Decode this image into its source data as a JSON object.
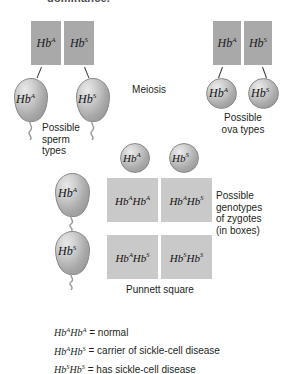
{
  "heading": {
    "text": "dominance."
  },
  "alleles": {
    "a": "Hb",
    "a_sup": "A",
    "s": "Hb",
    "s_sup": "S"
  },
  "parent_male": {
    "name": "male-parent-chromosomes",
    "chromosomes": [
      {
        "base": "Hb",
        "sup": "A"
      },
      {
        "base": "Hb",
        "sup": "S"
      }
    ]
  },
  "parent_female": {
    "name": "female-parent-chromosomes",
    "chromosomes": [
      {
        "base": "Hb",
        "sup": "A"
      },
      {
        "base": "Hb",
        "sup": "S"
      }
    ]
  },
  "meiosis_label": "Meiosis",
  "sperm": {
    "caption": [
      "Possible",
      "sperm",
      "types"
    ],
    "cells": [
      {
        "base": "Hb",
        "sup": "A"
      },
      {
        "base": "Hb",
        "sup": "S"
      }
    ]
  },
  "ova": {
    "caption": [
      "Possible",
      "ova types"
    ],
    "cells": [
      {
        "base": "Hb",
        "sup": "A"
      },
      {
        "base": "Hb",
        "sup": "S"
      }
    ]
  },
  "punnett": {
    "label": "Punnett square",
    "column_gametes": [
      {
        "base": "Hb",
        "sup": "A"
      },
      {
        "base": "Hb",
        "sup": "S"
      }
    ],
    "row_gametes": [
      {
        "base": "Hb",
        "sup": "A"
      },
      {
        "base": "Hb",
        "sup": "S"
      }
    ],
    "cells": [
      {
        "p1": "Hb",
        "s1": "A",
        "p2": "Hb",
        "s2": "A"
      },
      {
        "p1": "Hb",
        "s1": "A",
        "p2": "Hb",
        "s2": "S"
      },
      {
        "p1": "Hb",
        "s1": "A",
        "p2": "Hb",
        "s2": "S"
      },
      {
        "p1": "Hb",
        "s1": "S",
        "p2": "Hb",
        "s2": "S"
      }
    ],
    "caption": [
      "Possible",
      "genotypes",
      "of zygotes",
      "(in boxes)"
    ]
  },
  "legend": [
    {
      "g1": "Hb",
      "g1s": "A",
      "g2": "Hb",
      "g2s": "A",
      "desc": "= normal"
    },
    {
      "g1": "Hb",
      "g1s": "A",
      "g2": "Hb",
      "g2s": "S",
      "desc": "= carrier of sickle-cell disease"
    },
    {
      "g1": "Hb",
      "g1s": "S",
      "g2": "Hb",
      "g2s": "S",
      "desc": "= has sickle-cell disease"
    }
  ],
  "colors": {
    "chromosome_gray": "#a9a9a9",
    "cell_gray": "#b0b0b0",
    "punnett_gray": "#c9c9c9",
    "text": "#231f20"
  }
}
